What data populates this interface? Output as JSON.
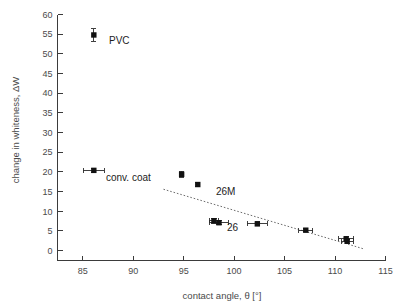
{
  "chart_data": {
    "type": "scatter",
    "title": "",
    "xlabel": "contact angle, θ [°]",
    "ylabel": "change in whiteness, ΔW",
    "xlim": [
      82.5,
      115
    ],
    "ylim": [
      -2.5,
      60
    ],
    "xticks": [
      85,
      90,
      95,
      100,
      105,
      110,
      115
    ],
    "yticks": [
      0,
      5,
      10,
      15,
      20,
      25,
      30,
      35,
      40,
      45,
      50,
      55,
      60
    ],
    "grid": false,
    "legend": "none",
    "points": [
      {
        "id": "pvc",
        "x": 86.1,
        "y": 54.8,
        "xerr": 0.0,
        "yerr": 1.6
      },
      {
        "id": "conv-coat",
        "x": 86.1,
        "y": 20.4,
        "xerr": 1.05,
        "yerr": 0.6
      },
      {
        "id": "p-94-8",
        "x": 94.8,
        "y": 19.4,
        "xerr": 0.0,
        "yerr": 0.8
      },
      {
        "id": "p-96-4",
        "x": 96.4,
        "y": 16.8,
        "xerr": 0.0,
        "yerr": 0.5
      },
      {
        "id": "p-98-0",
        "x": 98.0,
        "y": 7.6,
        "xerr": 0.45,
        "yerr": 0.6
      },
      {
        "id": "p-98-5",
        "x": 98.5,
        "y": 7.1,
        "xerr": 0.9,
        "yerr": 0.5
      },
      {
        "id": "p-102-3",
        "x": 102.3,
        "y": 6.8,
        "xerr": 1.0,
        "yerr": 0.5
      },
      {
        "id": "p-107-1",
        "x": 107.1,
        "y": 5.2,
        "xerr": 0.7,
        "yerr": 0.4
      },
      {
        "id": "p-111-1a",
        "x": 111.1,
        "y": 3.0,
        "xerr": 0.75,
        "yerr": 0.6
      },
      {
        "id": "p-111-2b",
        "x": 111.2,
        "y": 2.4,
        "xerr": 0.6,
        "yerr": 0.5
      }
    ],
    "trend": {
      "x0": 93.0,
      "y0": 15.6,
      "x1": 112.9,
      "y1": 0.4
    },
    "annotations": [
      {
        "id": "label-pvc",
        "text": "PVC",
        "x": 87.6,
        "y": 52.6
      },
      {
        "id": "label-conv-coat",
        "text": "conv. coat",
        "x": 87.3,
        "y": 17.6
      },
      {
        "id": "label-26m",
        "text": "26M",
        "x": 98.2,
        "y": 14.2
      },
      {
        "id": "label-26",
        "text": "26",
        "x": 99.3,
        "y": 4.9
      }
    ]
  }
}
